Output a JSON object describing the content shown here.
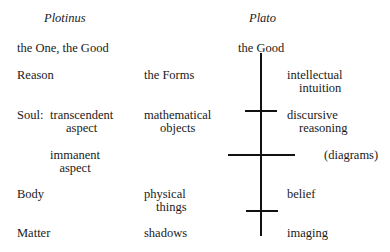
{
  "headers": {
    "plotinus": "Plotinus",
    "plato": "Plato"
  },
  "plotinus_column": {
    "one": "the One, the Good",
    "reason": "Reason",
    "soul": "Soul:",
    "transcendent_1": "transcendent",
    "transcendent_2": "aspect",
    "immanent_1": "immanent",
    "immanent_2": "aspect",
    "body": "Body",
    "matter": "Matter"
  },
  "objects_column": {
    "forms": "the Forms",
    "math_1": "mathematical",
    "math_2": "objects",
    "physical_1": "physical",
    "physical_2": "things",
    "shadows": "shadows"
  },
  "plato_column": {
    "good": "the Good",
    "intellectual_1": "intellectual",
    "intellectual_2": "intuition",
    "discursive_1": "discursive",
    "discursive_2": "reasoning",
    "diagrams": "(diagrams)",
    "belief": "belief",
    "imaging": "imaging"
  },
  "divided_line": {
    "color": "#111111",
    "vertical": {
      "x": 261,
      "y_start": 53,
      "y_end": 236
    },
    "crossbars": [
      {
        "y": 111,
        "x_start": 245,
        "x_end": 277
      },
      {
        "y": 155,
        "x_start": 228,
        "x_end": 295
      },
      {
        "y": 211,
        "x_start": 246,
        "x_end": 278
      }
    ]
  }
}
